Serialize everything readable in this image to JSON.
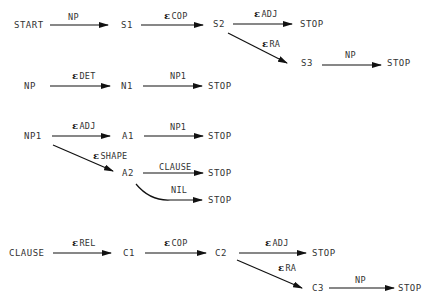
{
  "diagram": {
    "type": "augmented-transition-network",
    "epsilon_symbol": "ε",
    "networks": [
      {
        "name": "START",
        "nodes": [
          "START",
          "S1",
          "S2",
          "S3",
          "STOP",
          "STOP"
        ],
        "arcs": [
          {
            "from": "START",
            "to": "S1",
            "label": "NP",
            "epsilon": false
          },
          {
            "from": "S1",
            "to": "S2",
            "label": "COP",
            "epsilon": true
          },
          {
            "from": "S2",
            "to": "STOP",
            "label": "ADJ",
            "epsilon": true
          },
          {
            "from": "S2",
            "to": "S3",
            "label": "RA",
            "epsilon": true
          },
          {
            "from": "S3",
            "to": "STOP",
            "label": "NP",
            "epsilon": false
          }
        ]
      },
      {
        "name": "NP",
        "nodes": [
          "NP",
          "N1",
          "STOP"
        ],
        "arcs": [
          {
            "from": "NP",
            "to": "N1",
            "label": "DET",
            "epsilon": true
          },
          {
            "from": "N1",
            "to": "STOP",
            "label": "NP1",
            "epsilon": false
          }
        ]
      },
      {
        "name": "NP1",
        "nodes": [
          "NP1",
          "A1",
          "A2",
          "STOP",
          "STOP",
          "STOP"
        ],
        "arcs": [
          {
            "from": "NP1",
            "to": "A1",
            "label": "ADJ",
            "epsilon": true
          },
          {
            "from": "A1",
            "to": "STOP",
            "label": "NP1",
            "epsilon": false
          },
          {
            "from": "NP1",
            "to": "A2",
            "label": "SHAPE",
            "epsilon": true
          },
          {
            "from": "A2",
            "to": "STOP",
            "label": "CLAUSE",
            "epsilon": false
          },
          {
            "from": "A2",
            "to": "STOP",
            "label": "NIL",
            "epsilon": false
          }
        ]
      },
      {
        "name": "CLAUSE",
        "nodes": [
          "CLAUSE",
          "C1",
          "C2",
          "C3",
          "STOP",
          "STOP"
        ],
        "arcs": [
          {
            "from": "CLAUSE",
            "to": "C1",
            "label": "REL",
            "epsilon": true
          },
          {
            "from": "C1",
            "to": "C2",
            "label": "COP",
            "epsilon": true
          },
          {
            "from": "C2",
            "to": "STOP",
            "label": "ADJ",
            "epsilon": true
          },
          {
            "from": "C2",
            "to": "C3",
            "label": "RA",
            "epsilon": true
          },
          {
            "from": "C3",
            "to": "STOP",
            "label": "NP",
            "epsilon": false
          }
        ]
      }
    ]
  },
  "labels": {
    "start": "START",
    "s1": "S1",
    "s2": "S2",
    "s3": "S3",
    "stop": "STOP",
    "np": "NP",
    "n1": "N1",
    "np1": "NP1",
    "a1": "A1",
    "a2": "A2",
    "clause": "CLAUSE",
    "c1": "C1",
    "c2": "C2",
    "c3": "C3",
    "arc_np": "NP",
    "arc_cop": "COP",
    "arc_adj": "ADJ",
    "arc_ra": "RA",
    "arc_det": "DET",
    "arc_np1": "NP1",
    "arc_shape": "SHAPE",
    "arc_clause": "CLAUSE",
    "arc_nil": "NIL",
    "arc_rel": "REL",
    "eps": "ε"
  }
}
